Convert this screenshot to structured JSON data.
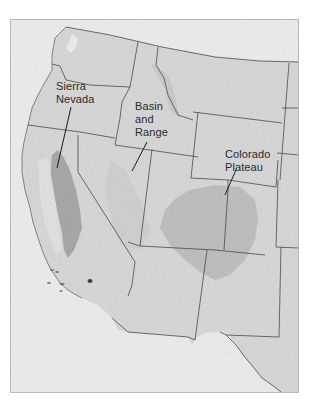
{
  "map": {
    "type": "shaded-relief physiographic map",
    "region": "Western United States",
    "colors": {
      "ocean": "#ececec",
      "land": "#d6d6d6",
      "relief_dark": "#8f8f8f",
      "state_lines": "#4a4a4a",
      "frame": "#b9b9b9",
      "label_text": "#2a2a2a"
    },
    "labels": [
      {
        "id": "sierra-nevada",
        "line1": "Sierra",
        "line2": "Nevada"
      },
      {
        "id": "basin-and-range",
        "line1": "Basin",
        "line2": "and",
        "line3": "Range"
      },
      {
        "id": "colorado-plateau",
        "line1": "Colorado",
        "line2": "Plateau"
      }
    ]
  }
}
